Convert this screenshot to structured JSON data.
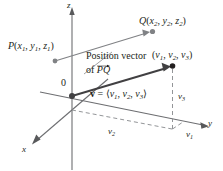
{
  "figure": {
    "colors": {
      "ink": "#231f20",
      "axis": "#6d6e71",
      "vector": "#58595b",
      "dashed": "#939598",
      "point": "#808285",
      "background": "#ffffff"
    },
    "axes": {
      "z_label": "z",
      "x_label": "x",
      "y_label": "y",
      "origin_label": "0"
    },
    "points": {
      "P": {
        "name": "P",
        "coords": "(x1, y1, z1)",
        "x_sub": "1",
        "y_sub": "1",
        "z_sub": "1"
      },
      "Q": {
        "name": "Q",
        "coords": "(x2, y2, z2)",
        "x_sub": "2",
        "y_sub": "2",
        "z_sub": "2"
      },
      "tip": {
        "coords": "(v1, v2, v3)"
      }
    },
    "annotations": {
      "position_vector_line1": "Position vector",
      "position_vector_line2_prefix": "of",
      "position_vector_line2_vector": "PQ",
      "vector_equation_symbol": "v",
      "vector_equation_equals": "=",
      "vector_equation_components": "⟨v1, v2, v3⟩",
      "component_v1": "v1",
      "component_v2": "v2",
      "component_v3": "v3"
    },
    "letters": {
      "v": "v",
      "x": "x",
      "y": "y",
      "z": "z",
      "P": "P",
      "Q": "Q",
      "one": "1",
      "two": "2",
      "three": "3",
      "equals": "=",
      "comma": ",",
      "lparen": "(",
      "rparen": ")",
      "langle": "⟨",
      "rangle": "⟩"
    }
  }
}
